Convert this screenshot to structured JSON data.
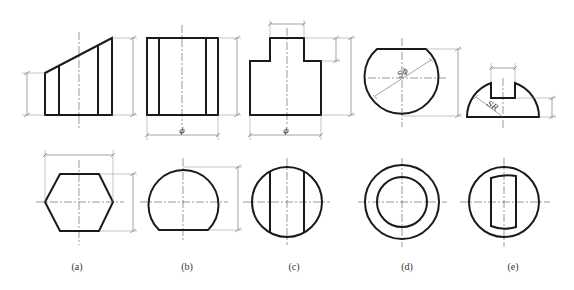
{
  "figure": {
    "stroke_color": "#1a1a1a",
    "background": "#ffffff"
  },
  "views": [
    {
      "id": "a",
      "caption": "(a)",
      "front_shape": "truncated-hexagonal-prism (sloped top)",
      "top_shape": "hexagon",
      "dim_labels": []
    },
    {
      "id": "b",
      "caption": "(b)",
      "front_shape": "cylinder rectangle with two inner lines",
      "top_shape": "circle with flat bottom",
      "dim_labels": [
        "ϕ"
      ]
    },
    {
      "id": "c",
      "caption": "(c)",
      "front_shape": "stepped cylinder",
      "top_shape": "circle with two vertical chords",
      "dim_labels": [
        "ϕ"
      ]
    },
    {
      "id": "d",
      "caption": "(d)",
      "front_shape": "truncated sphere",
      "top_shape": "concentric circles",
      "dim_labels": [
        "Sϕ"
      ]
    },
    {
      "id": "e",
      "caption": "(e)",
      "front_shape": "hemisphere with slot",
      "top_shape": "circle with slot",
      "dim_labels": [
        "SR"
      ]
    }
  ]
}
